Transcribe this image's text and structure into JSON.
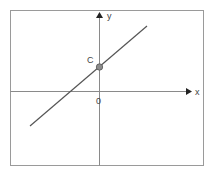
{
  "diagram": {
    "type": "linear-function-graph",
    "axes": {
      "x_label": "x",
      "y_label": "y",
      "origin_label": "0"
    },
    "point": {
      "label": "C",
      "meaning": "y-intercept"
    },
    "line": {
      "slope_sign": "positive",
      "intercept_sign": "positive"
    },
    "colors": {
      "frame": "#9a9a9a",
      "axes": "#8a8a8a",
      "line": "#555555",
      "point_fill": "#8c8c8c",
      "text": "#444444"
    }
  }
}
